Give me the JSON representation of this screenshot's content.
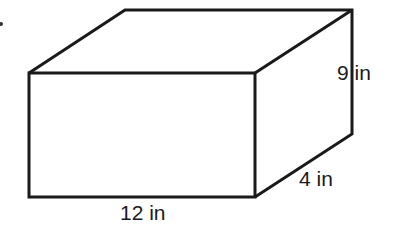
{
  "figure": {
    "type": "rectangular prism",
    "dimensions": {
      "length": "12 in",
      "width": "4 in",
      "height": "9 in"
    },
    "labels": {
      "height": "9 in",
      "width": "4 in",
      "length": "12 in"
    },
    "stroke_color": "#1a1a1a"
  }
}
